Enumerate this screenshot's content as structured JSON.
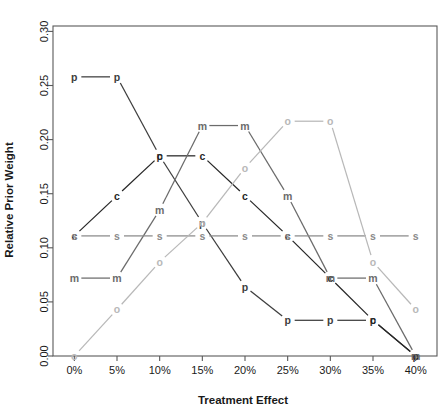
{
  "chart_data": {
    "type": "line",
    "title": "",
    "xlabel": "Treatment Effect",
    "ylabel": "Relative Prior Weight",
    "categories": [
      "0%",
      "5%",
      "10%",
      "15%",
      "20%",
      "25%",
      "30%",
      "35%",
      "40%"
    ],
    "x": [
      0,
      5,
      10,
      15,
      20,
      25,
      30,
      35,
      40
    ],
    "xlim": [
      -2.5,
      42.5
    ],
    "ylim": [
      0.0,
      0.305
    ],
    "yticks": [
      0.0,
      0.05,
      0.1,
      0.15,
      0.2,
      0.25,
      0.3
    ],
    "ytick_labels": [
      "0.00",
      "0.05",
      "0.10",
      "0.15",
      "0.20",
      "0.25",
      "0.30"
    ],
    "xticks": [
      0,
      5,
      10,
      15,
      20,
      25,
      30,
      35,
      40
    ],
    "xtick_labels": [
      "0%",
      "5%",
      "10%",
      "15%",
      "20%",
      "25%",
      "30%",
      "35%",
      "40%"
    ],
    "grid": false,
    "legend": "none",
    "point_labels_as_markers": true,
    "series": [
      {
        "name": "p",
        "marker": "p",
        "color": "#3d3d3d",
        "values": [
          0.258,
          0.258,
          0.185,
          0.123,
          0.064,
          0.033,
          0.033,
          0.033,
          0.0
        ]
      },
      {
        "name": "c",
        "marker": "c",
        "color": "#262626",
        "values": [
          0.111,
          0.148,
          0.185,
          0.185,
          0.148,
          0.111,
          0.072,
          0.033,
          0.0
        ]
      },
      {
        "name": "m",
        "marker": "m",
        "color": "#6b6b6b",
        "values": [
          0.072,
          0.072,
          0.135,
          0.213,
          0.213,
          0.148,
          0.072,
          0.072,
          0.0
        ]
      },
      {
        "name": "s",
        "marker": "s",
        "color": "#8a8a8a",
        "values": [
          0.111,
          0.111,
          0.111,
          0.111,
          0.111,
          0.111,
          0.111,
          0.111,
          0.111
        ]
      },
      {
        "name": "o",
        "marker": "o",
        "color": "#b8b8b8",
        "values": [
          0.0,
          0.043,
          0.087,
          0.123,
          0.174,
          0.217,
          0.217,
          0.087,
          0.043
        ]
      }
    ]
  }
}
